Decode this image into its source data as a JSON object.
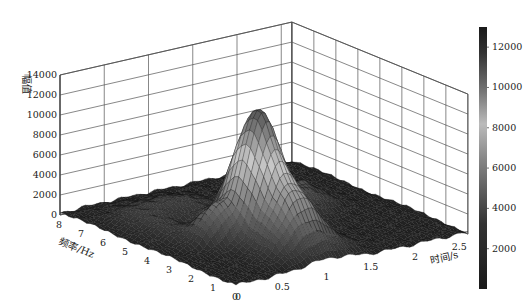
{
  "chart_data": {
    "type": "surface3d",
    "title": "",
    "xlabel": "时间/s",
    "ylabel": "频率/Hz",
    "zlabel": "幅值",
    "x_ticks": [
      "0",
      "0.5",
      "1",
      "1.5",
      "2",
      "2.5"
    ],
    "x_tick_values": [
      0,
      0.5,
      1,
      1.5,
      2,
      2.5
    ],
    "y_ticks": [
      "0",
      "1",
      "2",
      "3",
      "4",
      "5",
      "6",
      "7",
      "8"
    ],
    "y_tick_values": [
      0,
      1,
      2,
      3,
      4,
      5,
      6,
      7,
      8
    ],
    "z_ticks": [
      "0",
      "2000",
      "4000",
      "6000",
      "8000",
      "10000",
      "12000",
      "14000"
    ],
    "z_tick_values": [
      0,
      2000,
      4000,
      6000,
      8000,
      10000,
      12000,
      14000
    ],
    "xlim": [
      0,
      2.62
    ],
    "ylim": [
      0,
      8
    ],
    "zlim": [
      0,
      14000
    ],
    "grid": true,
    "colorbar": {
      "position": "right",
      "ticks": [
        "2000",
        "4000",
        "6000",
        "8000",
        "10000",
        "12000"
      ],
      "tick_values": [
        2000,
        4000,
        6000,
        8000,
        10000,
        12000
      ],
      "range": [
        0,
        13000
      ]
    },
    "peaks": [
      {
        "name": "main-peak",
        "time": 1.0,
        "freq": 3.0,
        "amplitude": 12800,
        "sigma_t": 0.18,
        "sigma_f": 0.9
      },
      {
        "name": "ridge-low-freq",
        "time": 1.05,
        "freq": 1.2,
        "amplitude": 3800,
        "sigma_t": 0.25,
        "sigma_f": 0.6
      },
      {
        "name": "mid-bump",
        "time": 0.55,
        "freq": 3.3,
        "amplitude": 3000,
        "sigma_t": 0.12,
        "sigma_f": 0.5
      },
      {
        "name": "right-bump-1",
        "time": 1.55,
        "freq": 4.2,
        "amplitude": 2200,
        "sigma_t": 0.2,
        "sigma_f": 0.8
      },
      {
        "name": "right-bump-2",
        "time": 1.9,
        "freq": 4.6,
        "amplitude": 1900,
        "sigma_t": 0.18,
        "sigma_f": 0.6
      },
      {
        "name": "back-ripple",
        "time": 0.8,
        "freq": 6.2,
        "amplitude": 1500,
        "sigma_t": 0.3,
        "sigma_f": 0.7
      },
      {
        "name": "left-ridge",
        "time": 0.35,
        "freq": 5.0,
        "amplitude": 1200,
        "sigma_t": 0.15,
        "sigma_f": 1.2
      }
    ],
    "background_noise": 400,
    "colormap": "gray (dark low, light mid-high, dark top)"
  }
}
